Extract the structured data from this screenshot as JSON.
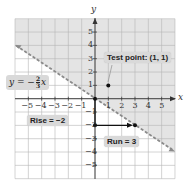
{
  "chart_data": {
    "type": "line",
    "title": "",
    "xlabel": "x",
    "ylabel": "y",
    "xlim": [
      -6,
      6
    ],
    "ylim": [
      -6,
      6
    ],
    "grid": true,
    "x_ticks": [
      -5,
      -4,
      -3,
      -2,
      -1,
      1,
      2,
      3,
      4,
      5
    ],
    "y_ticks": [
      5,
      4,
      3,
      2,
      1,
      -1,
      -2,
      -3,
      -4,
      -5
    ],
    "series": [
      {
        "name": "boundary line",
        "equation": "y = -(2/3)x",
        "style": "dashed",
        "color": "#8a8a8a",
        "x": [
          -6,
          6
        ],
        "y": [
          4,
          -4
        ]
      }
    ],
    "shaded_region": "y > -(2/3)x (above line)",
    "points": [
      {
        "name": "Test point",
        "x": 1,
        "y": 1
      },
      {
        "name": "origin",
        "x": 0,
        "y": 0
      },
      {
        "name": "rise end",
        "x": 0,
        "y": -2
      },
      {
        "name": "run end",
        "x": 3,
        "y": -2
      }
    ],
    "annotations": [
      {
        "text": "y = -2/3 x",
        "type": "equation-label"
      },
      {
        "text": "Test point: (1, 1)"
      },
      {
        "text": "Rise = −2"
      },
      {
        "text": "Run = 3"
      }
    ]
  },
  "labels": {
    "x_axis": "x",
    "y_axis": "y",
    "equation_prefix": "y = −",
    "equation_num": "2",
    "equation_den": "3",
    "equation_var": "x",
    "test_point": "Test point: (1, 1)",
    "rise": "Rise = −2",
    "run": "Run = 3"
  },
  "x_tick_labels": [
    "−5",
    "−4",
    "−3",
    "−2",
    "−1",
    "1",
    "2",
    "3",
    "4",
    "5"
  ],
  "y_tick_labels": [
    "5",
    "4",
    "3",
    "2",
    "1",
    "−1",
    "−2",
    "−3",
    "−4",
    "−5"
  ],
  "colors": {
    "shade": "#e4e4e4",
    "grid": "#b5b5b5",
    "axis": "#333333",
    "line": "#8a8a8a",
    "label_bg": "#d9d9d9",
    "point": "#111111"
  }
}
